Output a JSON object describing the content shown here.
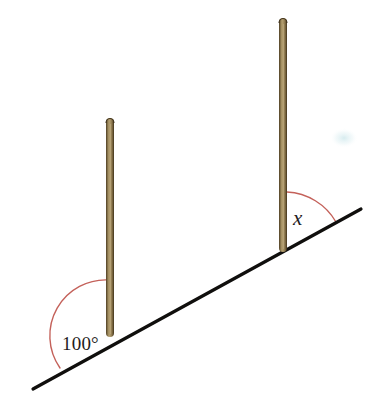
{
  "figure": {
    "background_color": "#ffffff",
    "width": 384,
    "height": 407
  },
  "ground": {
    "name": "inclined-ground-line",
    "color": "#100f0d",
    "thickness": 3.2,
    "x1": 33,
    "y1": 389,
    "x2": 361,
    "y2": 209
  },
  "poles": [
    {
      "name": "left-pole",
      "label": "left vertical pole",
      "x": 106,
      "top_y": 118,
      "base_y": 336,
      "width": 8,
      "fill_color": "#9d8963",
      "edge_color": "#4a3a23",
      "highlight_color": "#c3b085"
    },
    {
      "name": "right-pole",
      "label": "right vertical pole",
      "x": 279,
      "top_y": 18,
      "base_y": 251,
      "width": 8,
      "fill_color": "#9d8963",
      "edge_color": "#4a3a23",
      "highlight_color": "#c3b085"
    }
  ],
  "angles": [
    {
      "name": "angle-100-degrees",
      "value_label": "100°",
      "arc_color": "#c4615a",
      "arc_width": 1.4,
      "vertex_x": 110,
      "vertex_y": 336,
      "radius": 56,
      "label_x": 62,
      "label_y": 350
    },
    {
      "name": "angle-x",
      "value_label": "x",
      "arc_color": "#c4615a",
      "arc_width": 1.4,
      "vertex_x": 283,
      "vertex_y": 251,
      "radius": 60,
      "label_x": 293,
      "label_y": 225
    }
  ],
  "artifacts": [
    {
      "name": "scan-smudge",
      "color": "#dceef0",
      "x": 344,
      "y": 138,
      "rx": 13,
      "ry": 9
    }
  ]
}
